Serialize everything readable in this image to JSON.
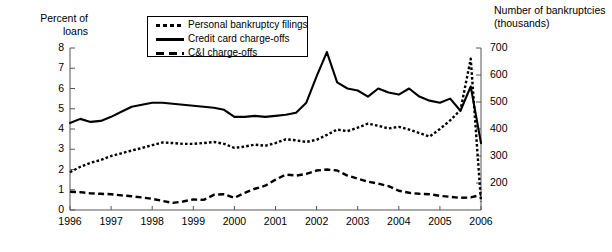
{
  "chart_data": {
    "type": "line",
    "title": "",
    "xlabel": "",
    "ylabel": "Percent of loans",
    "y2label": "Number of bankruptcies (thousands)",
    "grid": false,
    "legend_position": "top-center",
    "xlim": [
      1996,
      2006
    ],
    "ylim": [
      0,
      8
    ],
    "y2lim": [
      100,
      700
    ],
    "xticks": [
      "1996",
      "1997",
      "1998",
      "1999",
      "2000",
      "2001",
      "2002",
      "2003",
      "2004",
      "2005",
      "2006"
    ],
    "yticks": [
      "0",
      "1",
      "2",
      "3",
      "4",
      "5",
      "6",
      "7",
      "8"
    ],
    "y2ticks": [
      "200",
      "300",
      "400",
      "500",
      "600",
      "700"
    ],
    "left_axis_title": "Percent of\nloans",
    "right_axis_title": "Number of bankruptcies\n(thousands)",
    "x": [
      1996.0,
      1996.25,
      1996.5,
      1996.75,
      1997.0,
      1997.25,
      1997.5,
      1997.75,
      1998.0,
      1998.25,
      1998.5,
      1998.75,
      1999.0,
      1999.25,
      1999.5,
      1999.75,
      2000.0,
      2000.25,
      2000.5,
      2000.75,
      2001.0,
      2001.25,
      2001.5,
      2001.75,
      2002.0,
      2002.25,
      2002.5,
      2002.75,
      2003.0,
      2003.25,
      2003.5,
      2003.75,
      2004.0,
      2004.25,
      2004.5,
      2004.75,
      2005.0,
      2005.25,
      2005.5,
      2005.75,
      2006.0
    ],
    "series": [
      {
        "name": "Personal bankruptcy filings",
        "axis": "right",
        "style": "dotted",
        "units": "thousands",
        "values": [
          240,
          260,
          275,
          285,
          300,
          310,
          320,
          330,
          340,
          350,
          348,
          345,
          345,
          348,
          352,
          345,
          330,
          335,
          342,
          338,
          348,
          362,
          358,
          352,
          360,
          378,
          398,
          392,
          405,
          420,
          412,
          402,
          408,
          398,
          385,
          372,
          400,
          432,
          470,
          660,
          130
        ]
      },
      {
        "name": "Credit card charge-offs",
        "axis": "left",
        "style": "solid",
        "units": "percent",
        "values": [
          4.3,
          4.5,
          4.35,
          4.4,
          4.6,
          4.85,
          5.1,
          5.2,
          5.3,
          5.3,
          5.25,
          5.2,
          5.15,
          5.1,
          5.05,
          4.95,
          4.6,
          4.6,
          4.65,
          4.6,
          4.65,
          4.7,
          4.8,
          5.3,
          6.6,
          7.8,
          6.3,
          6.0,
          5.9,
          5.6,
          6.0,
          5.8,
          5.7,
          6.0,
          5.6,
          5.4,
          5.3,
          5.5,
          4.9,
          6.1,
          3.3
        ]
      },
      {
        "name": "C&I charge-offs",
        "axis": "left",
        "style": "dashed",
        "units": "percent",
        "values": [
          0.9,
          0.88,
          0.82,
          0.8,
          0.78,
          0.72,
          0.68,
          0.62,
          0.55,
          0.45,
          0.35,
          0.42,
          0.52,
          0.5,
          0.75,
          0.78,
          0.6,
          0.85,
          1.05,
          1.2,
          1.5,
          1.75,
          1.7,
          1.78,
          1.95,
          2.0,
          1.95,
          1.7,
          1.55,
          1.4,
          1.3,
          1.18,
          0.95,
          0.85,
          0.8,
          0.78,
          0.7,
          0.65,
          0.6,
          0.62,
          0.75
        ]
      }
    ],
    "annotations": [
      "Credit card charge-offs peak near 7.8 percent in mid-2002",
      "Personal bankruptcy filings spike to about 660 thousand in late 2005, then fall sharply to about 130 thousand"
    ]
  },
  "legend": {
    "items": [
      {
        "label": "Personal bankruptcy filings",
        "key": "dotted"
      },
      {
        "label": "Credit card charge-offs",
        "key": "solid"
      },
      {
        "label": "C&I charge-offs",
        "key": "dashed"
      }
    ]
  }
}
